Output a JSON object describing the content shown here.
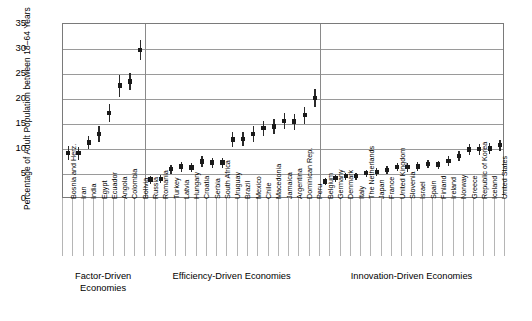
{
  "chart_data": {
    "type": "scatter",
    "title": "",
    "xlabel": "",
    "ylabel": "Percentage of Adult Population between 18–64 Years",
    "ylim": [
      0,
      35
    ],
    "yticks": [
      0,
      5,
      10,
      15,
      20,
      25,
      30,
      35
    ],
    "grid": true,
    "legend": null,
    "marker": "point-with-confidence-interval",
    "groups": [
      {
        "name": "Factor-Driven Economies",
        "caption_line1": "Factor-Driven",
        "caption_line2": "Economies",
        "categories": [
          "Bosnia and Herz.",
          "Iran",
          "India",
          "Egypt",
          "Ecuador",
          "Angola",
          "Colombia",
          "Bolivia"
        ],
        "values": [
          9.2,
          9.2,
          11.3,
          13.0,
          17.2,
          22.7,
          23.5,
          29.8
        ],
        "ci_low": [
          7.8,
          7.9,
          10.1,
          11.4,
          15.4,
          20.5,
          21.8,
          27.8
        ],
        "ci_high": [
          10.6,
          10.5,
          12.6,
          14.6,
          19.0,
          24.9,
          25.2,
          31.8
        ]
      },
      {
        "name": "Efficiency-Driven Economies",
        "caption_line1": "Efficiency-Driven Economies",
        "caption_line2": "",
        "categories": [
          "Russia",
          "Romania",
          "Turkey",
          "Latvia",
          "Hungary",
          "Croatia",
          "Serbia",
          "South Africa",
          "Uruguay",
          "Brazil",
          "Mexico",
          "Chile",
          "Macedonia",
          "Jamaica",
          "Argentina",
          "Dominican Rep.",
          "Peru"
        ],
        "values": [
          3.9,
          4.0,
          6.0,
          6.5,
          6.3,
          7.5,
          7.3,
          7.3,
          11.9,
          12.0,
          13.0,
          14.2,
          14.5,
          15.6,
          15.5,
          16.8,
          20.2,
          25.6
        ],
        "ci_low": [
          3.1,
          3.2,
          5.1,
          5.5,
          5.4,
          6.4,
          6.3,
          6.3,
          10.4,
          10.6,
          11.4,
          12.7,
          13.0,
          14.0,
          13.9,
          15.1,
          18.4,
          23.6
        ],
        "ci_high": [
          4.7,
          4.8,
          6.9,
          7.5,
          7.2,
          8.6,
          8.3,
          8.3,
          13.4,
          13.4,
          14.6,
          15.7,
          16.0,
          17.2,
          17.1,
          18.5,
          22.0,
          27.6
        ]
      },
      {
        "name": "Innovation-Driven Economies",
        "caption_line1": "Innovation-Driven Economies",
        "caption_line2": "",
        "categories": [
          "Belgium",
          "Germany",
          "Denmark",
          "Italy",
          "The Netherlands",
          "Japan",
          "France",
          "United Kingdom",
          "Slovenia",
          "Israel",
          "Spain",
          "Finland",
          "Ireland",
          "Norway",
          "Greece",
          "Republic of Korea",
          "Iceland",
          "United States"
        ],
        "values": [
          3.5,
          4.2,
          4.6,
          4.6,
          5.2,
          5.4,
          5.8,
          6.4,
          6.4,
          6.5,
          7.0,
          6.9,
          7.6,
          8.6,
          9.9,
          10.0,
          10.1,
          10.8
        ],
        "ci_low": [
          2.8,
          3.5,
          3.9,
          3.9,
          4.5,
          4.6,
          5.0,
          5.6,
          5.5,
          5.6,
          6.2,
          6.1,
          6.6,
          7.6,
          8.8,
          8.9,
          9.0,
          9.7
        ],
        "ci_high": [
          4.2,
          4.9,
          5.3,
          5.3,
          5.9,
          6.2,
          6.6,
          7.2,
          7.3,
          7.4,
          7.8,
          7.7,
          8.6,
          9.6,
          11.0,
          11.1,
          11.2,
          11.9
        ]
      }
    ]
  }
}
